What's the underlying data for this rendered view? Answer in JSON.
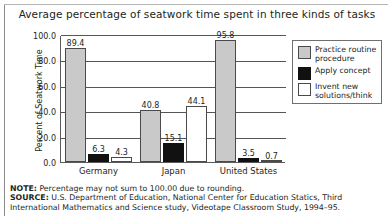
{
  "chart_data": {
    "type": "bar",
    "title": "Average percentage of seatwork time spent in three kinds of tasks",
    "xlabel": "",
    "ylabel": "Percent of Seatwork Time",
    "categories": [
      "Germany",
      "Japan",
      "United States"
    ],
    "series": [
      {
        "name": "Practice routine procedure",
        "color": "#c9c9c9",
        "values": [
          89.4,
          40.8,
          95.8
        ]
      },
      {
        "name": "Apply concept",
        "color": "#111111",
        "values": [
          6.3,
          15.1,
          3.5
        ]
      },
      {
        "name": "Invent new solutions/think",
        "color": "#ffffff",
        "values": [
          4.3,
          44.1,
          0.7
        ]
      }
    ],
    "ylim": [
      0.0,
      100.0
    ],
    "yticks": [
      "100.0",
      "80.0",
      "60.0",
      "40.0",
      "20.0",
      "0.0"
    ],
    "ytick_values": [
      100.0,
      80.0,
      60.0,
      40.0,
      20.0,
      0.0
    ],
    "grid": true,
    "legend_position": "right",
    "data_labels": [
      [
        "89.4",
        "6.3",
        "4.3"
      ],
      [
        "40.8",
        "15.1",
        "44.1"
      ],
      [
        "95.8",
        "3.5",
        "0.7"
      ]
    ]
  },
  "legend": {
    "items": [
      {
        "label": "Practice routine procedure"
      },
      {
        "label": "Apply concept"
      },
      {
        "label": "Invent new solutions/think"
      }
    ]
  },
  "footnotes": {
    "note_label": "NOTE:",
    "note_text": " Percentage may not sum to 100.00 due to rounding.",
    "source_label": "SOURCE:",
    "source_text": " U.S. Department of Education, National Center for Education Statics, Third International Mathematics and Science study, Videotape Classroom Study, 1994–95."
  }
}
